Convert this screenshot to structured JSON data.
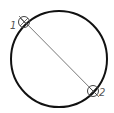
{
  "diagram": {
    "type": "circle-with-diameter",
    "circle": {
      "cx": 59,
      "cy": 59,
      "r": 48,
      "stroke": "#111111"
    },
    "diameter_line": {
      "x1": 19,
      "y1": 16,
      "x2": 99,
      "y2": 97,
      "stroke": "#555555"
    },
    "points": [
      {
        "label": "1",
        "x": 24,
        "y": 22
      },
      {
        "label": "2",
        "x": 93,
        "y": 91
      }
    ]
  }
}
